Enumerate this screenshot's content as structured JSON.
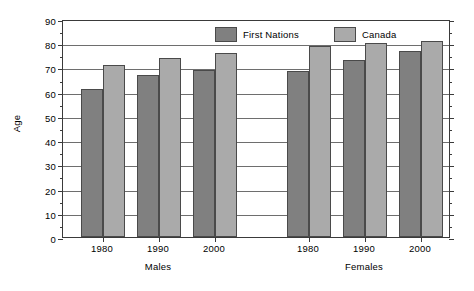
{
  "chart_data": {
    "type": "bar",
    "title": "",
    "xlabel": "",
    "ylabel": "Age",
    "ylim": [
      0,
      90
    ],
    "ytick_step": 10,
    "yticks": [
      0,
      10,
      20,
      30,
      40,
      50,
      60,
      70,
      80,
      90
    ],
    "grid": true,
    "legend_position": "top-center",
    "groups": [
      "Males",
      "Females"
    ],
    "categories": [
      "1980",
      "1990",
      "2000"
    ],
    "series": [
      {
        "name": "First Nations",
        "color": "#808080",
        "values_by_group": {
          "Males": [
            61,
            67,
            69
          ],
          "Females": [
            68.5,
            73,
            77
          ]
        }
      },
      {
        "name": "Canada",
        "color": "#aaaaaa",
        "values_by_group": {
          "Males": [
            71,
            74,
            76
          ],
          "Females": [
            79,
            80,
            81
          ]
        }
      }
    ]
  },
  "axes": {
    "y_title": "Age",
    "y_labels": [
      "90",
      "80",
      "70",
      "60",
      "50",
      "40",
      "30",
      "20",
      "10",
      "0"
    ],
    "x_labels_males": [
      "1980",
      "1990",
      "2000"
    ],
    "x_labels_females": [
      "1980",
      "1990",
      "2000"
    ],
    "group_label_males": "Males",
    "group_label_females": "Females"
  },
  "legend": {
    "entries": [
      {
        "label": "First Nations",
        "color": "#808080"
      },
      {
        "label": "Canada",
        "color": "#aaaaaa"
      }
    ]
  },
  "colors": {
    "first_nations": "#808080",
    "canada": "#aaaaaa",
    "axis": "#3a3a3a",
    "gridline": "#6e6e6e",
    "background": "#ffffff"
  }
}
